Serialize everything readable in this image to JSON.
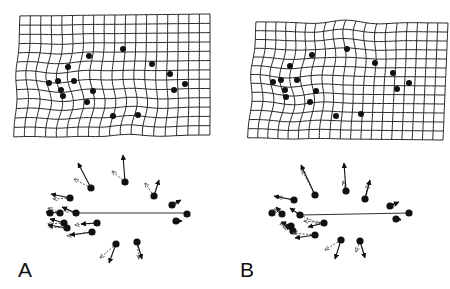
{
  "figure": {
    "panels": [
      {
        "id": "A",
        "label": "A",
        "label_pos": [
          18,
          280
        ],
        "grid": {
          "corners": {
            "tl": [
              20,
              16
            ],
            "tr": [
              210,
              14
            ],
            "bl": [
              14,
              137
            ],
            "br": [
              210,
              135
            ]
          },
          "cols": 18,
          "rows": 13,
          "warp": [
            {
              "cx": 60,
              "cy": 88,
              "amp": 4
            },
            {
              "cx": 130,
              "cy": 118,
              "amp": -3
            }
          ]
        },
        "grid_landmarks": [
          [
            89,
            56
          ],
          [
            123,
            49
          ],
          [
            68,
            67
          ],
          [
            152,
            64
          ],
          [
            170,
            74
          ],
          [
            185,
            84
          ],
          [
            174,
            90
          ],
          [
            49,
            83
          ],
          [
            58,
            81
          ],
          [
            74,
            81
          ],
          [
            61,
            90
          ],
          [
            63,
            96
          ],
          [
            93,
            91
          ],
          [
            87,
            102
          ],
          [
            113,
            116
          ],
          [
            138,
            115
          ]
        ],
        "baseline": [
          [
            76,
            213
          ],
          [
            187,
            213
          ]
        ],
        "vector_landmarks": [
          {
            "p": [
              91,
              188
            ],
            "solid": [
              -13,
              -25
            ],
            "dashed": [
              -17,
              -9
            ]
          },
          {
            "p": [
              125,
              182
            ],
            "solid": [
              -2,
              -27
            ],
            "dashed": [
              -13,
              -11
            ]
          },
          {
            "p": [
              154,
              196
            ],
            "solid": [
              5,
              -16
            ],
            "dashed": [
              -9,
              -13
            ]
          },
          {
            "p": [
              172,
              205
            ],
            "solid": [
              9,
              -5
            ],
            "dashed": [
              6,
              -3
            ]
          },
          {
            "p": [
              187,
              214
            ],
            "solid": [
              0,
              0
            ],
            "dashed": [
              0,
              0
            ]
          },
          {
            "p": [
              176,
              221
            ],
            "solid": [
              6,
              0
            ],
            "dashed": [
              4,
              0
            ]
          },
          {
            "p": [
              70,
              198
            ],
            "solid": [
              -19,
              -4
            ],
            "dashed": [
              -17,
              1
            ]
          },
          {
            "p": [
              50,
              213
            ],
            "solid": [
              0,
              0
            ],
            "dashed": [
              0,
              0
            ]
          },
          {
            "p": [
              60,
              213
            ],
            "solid": [
              -14,
              -1
            ],
            "dashed": [
              -12,
              -5
            ]
          },
          {
            "p": [
              76,
              213
            ],
            "solid": [
              -14,
              -6
            ],
            "dashed": [
              -12,
              -3
            ]
          },
          {
            "p": [
              64,
              223
            ],
            "solid": [
              -14,
              -4
            ],
            "dashed": [
              -16,
              1
            ]
          },
          {
            "p": [
              67,
              228
            ],
            "solid": [
              -19,
              -3
            ],
            "dashed": [
              -18,
              -1
            ]
          },
          {
            "p": [
              97,
              223
            ],
            "solid": [
              -16,
              1
            ],
            "dashed": [
              -22,
              2
            ]
          },
          {
            "p": [
              92,
              232
            ],
            "solid": [
              -22,
              3
            ],
            "dashed": [
              -25,
              4
            ]
          },
          {
            "p": [
              116,
              244
            ],
            "solid": [
              -7,
              19
            ],
            "dashed": [
              -16,
              14
            ]
          },
          {
            "p": [
              137,
              242
            ],
            "solid": [
              5,
              17
            ],
            "dashed": [
              2,
              17
            ]
          }
        ]
      },
      {
        "id": "B",
        "label": "B",
        "label_pos": [
          240,
          280
        ],
        "grid": {
          "corners": {
            "tl": [
              256,
              22
            ],
            "tr": [
              448,
              23
            ],
            "bl": [
              248,
              138
            ],
            "br": [
              443,
              140
            ]
          },
          "cols": 19,
          "rows": 13,
          "warp": [
            {
              "cx": 347,
              "cy": 20,
              "amp": -4
            },
            {
              "cx": 290,
              "cy": 88,
              "amp": 4
            }
          ]
        },
        "grid_landmarks": [
          [
            312,
            55
          ],
          [
            347,
            49
          ],
          [
            290,
            66
          ],
          [
            375,
            63
          ],
          [
            393,
            73
          ],
          [
            409,
            83
          ],
          [
            397,
            89
          ],
          [
            273,
            82
          ],
          [
            281,
            80
          ],
          [
            297,
            80
          ],
          [
            285,
            90
          ],
          [
            286,
            97
          ],
          [
            316,
            91
          ],
          [
            310,
            102
          ],
          [
            336,
            116
          ],
          [
            361,
            114
          ]
        ],
        "baseline": [
          [
            300,
            215
          ],
          [
            409,
            213
          ]
        ],
        "vector_landmarks": [
          {
            "p": [
              315,
              195
            ],
            "solid": [
              -14,
              -30
            ],
            "dashed": [
              -13,
              -25
            ]
          },
          {
            "p": [
              346,
              191
            ],
            "solid": [
              -2,
              -28
            ],
            "dashed": [
              -3,
              -10
            ]
          },
          {
            "p": [
              365,
              199
            ],
            "solid": [
              5,
              -19
            ],
            "dashed": [
              3,
              -15
            ]
          },
          {
            "p": [
              390,
              206
            ],
            "solid": [
              9,
              -4
            ],
            "dashed": [
              7,
              -2
            ]
          },
          {
            "p": [
              409,
              213
            ],
            "solid": [
              0,
              0
            ],
            "dashed": [
              0,
              0
            ]
          },
          {
            "p": [
              396,
              219
            ],
            "solid": [
              5,
              1
            ],
            "dashed": [
              4,
              0
            ]
          },
          {
            "p": [
              294,
              200
            ],
            "solid": [
              -20,
              -4
            ],
            "dashed": [
              -16,
              -3
            ]
          },
          {
            "p": [
              272,
              213
            ],
            "solid": [
              0,
              0
            ],
            "dashed": [
              0,
              0
            ]
          },
          {
            "p": [
              282,
              214
            ],
            "solid": [
              -6,
              -7
            ],
            "dashed": [
              -8,
              -5
            ]
          },
          {
            "p": [
              300,
              215
            ],
            "solid": [
              -10,
              -7
            ],
            "dashed": [
              20,
              9
            ]
          },
          {
            "p": [
              291,
              226
            ],
            "solid": [
              -10,
              -4
            ],
            "dashed": [
              -11,
              -2
            ]
          },
          {
            "p": [
              293,
              231
            ],
            "solid": [
              -8,
              -6
            ],
            "dashed": [
              -10,
              -4
            ]
          },
          {
            "p": [
              324,
              223
            ],
            "solid": [
              -16,
              4
            ],
            "dashed": [
              -20,
              -2
            ]
          },
          {
            "p": [
              315,
              235
            ],
            "solid": [
              -20,
              3
            ],
            "dashed": [
              -22,
              -2
            ]
          },
          {
            "p": [
              341,
              240
            ],
            "solid": [
              -6,
              19
            ],
            "dashed": [
              -16,
              10
            ]
          },
          {
            "p": [
              360,
              241
            ],
            "solid": [
              5,
              17
            ],
            "dashed": [
              -4,
              11
            ]
          }
        ]
      }
    ],
    "colors": {
      "ink": "#111111",
      "grid": "#2a2a2a",
      "dashed": "#555555"
    }
  }
}
